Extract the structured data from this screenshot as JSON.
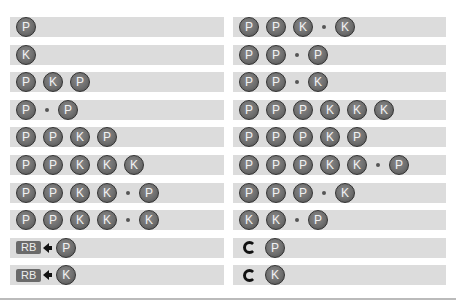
{
  "left_column": [
    {
      "tokens": [
        "P"
      ]
    },
    {
      "tokens": [
        "K"
      ]
    },
    {
      "tokens": [
        "P",
        "K",
        "P"
      ]
    },
    {
      "tokens": [
        "P",
        "•",
        "P"
      ]
    },
    {
      "tokens": [
        "P",
        "P",
        "K",
        "P"
      ]
    },
    {
      "tokens": [
        "P",
        "P",
        "K",
        "K",
        "K"
      ]
    },
    {
      "tokens": [
        "P",
        "P",
        "K",
        "K",
        "•",
        "P"
      ]
    },
    {
      "tokens": [
        "P",
        "P",
        "K",
        "K",
        "•",
        "K"
      ]
    },
    {
      "tokens": [
        "RB",
        "←",
        "P"
      ]
    },
    {
      "tokens": [
        "RB",
        "←",
        "K"
      ]
    }
  ],
  "right_column": [
    {
      "tokens": [
        "P",
        "P",
        "K",
        "•",
        "K"
      ]
    },
    {
      "tokens": [
        "P",
        "P",
        "•",
        "P"
      ]
    },
    {
      "tokens": [
        "P",
        "P",
        "•",
        "K"
      ]
    },
    {
      "tokens": [
        "P",
        "P",
        "P",
        "K",
        "K",
        "K"
      ]
    },
    {
      "tokens": [
        "P",
        "P",
        "P",
        "K",
        "P"
      ]
    },
    {
      "tokens": [
        "P",
        "P",
        "P",
        "K",
        "K",
        "•",
        "P"
      ]
    },
    {
      "tokens": [
        "P",
        "P",
        "P",
        "•",
        "K"
      ]
    },
    {
      "tokens": [
        "K",
        "K",
        "•",
        "P"
      ]
    },
    {
      "tokens": [
        "↻",
        "P"
      ]
    },
    {
      "tokens": [
        "↻",
        "K"
      ]
    }
  ],
  "legend": {
    "P": "punch-button",
    "K": "kick-button",
    "•": "then-separator",
    "RB": "rb-button",
    "←": "back-arrow",
    "↻": "rotate-icon"
  }
}
